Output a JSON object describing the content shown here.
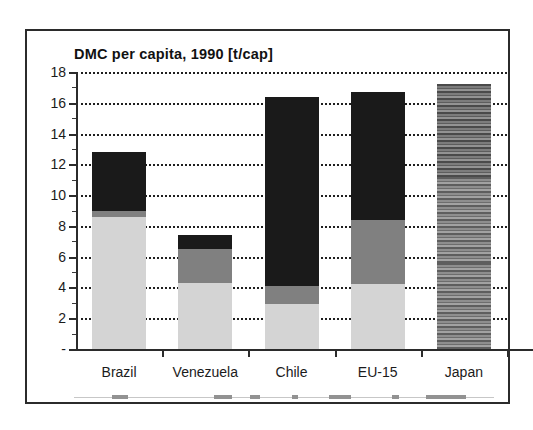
{
  "chart_data": {
    "type": "bar",
    "stacked": true,
    "title": "DMC per capita, 1990 [t/cap]",
    "xlabel": "",
    "ylabel": "",
    "ylim": [
      0,
      18
    ],
    "yticks": [
      "-",
      "2",
      "4",
      "6",
      "8",
      "10",
      "12",
      "14",
      "16",
      "18"
    ],
    "ytick_values": [
      0,
      2,
      4,
      6,
      8,
      10,
      12,
      14,
      16,
      18
    ],
    "grid": true,
    "legend_position": "bottom",
    "categories": [
      "Brazil",
      "Venezuela",
      "Chile",
      "EU-15",
      "Japan"
    ],
    "series": [
      {
        "name": "bottom-segment",
        "color": "#d4d4d4",
        "values": [
          8.6,
          4.3,
          2.9,
          4.2,
          5.6
        ]
      },
      {
        "name": "middle-segment",
        "color": "#808080",
        "values": [
          0.4,
          2.2,
          1.2,
          4.2,
          5.6
        ]
      },
      {
        "name": "top-segment",
        "color": "#1a1a1a",
        "values": [
          3.8,
          0.9,
          12.3,
          8.3,
          6.0
        ]
      }
    ],
    "totals": [
      12.8,
      7.4,
      16.4,
      16.7,
      17.2
    ]
  },
  "title": "DMC per capita, 1990 [t/cap]",
  "axis": {
    "y_labels": [
      "18",
      "16",
      "14",
      "12",
      "10",
      "8",
      "6",
      "4",
      "2",
      "-"
    ],
    "x_labels": [
      "Brazil",
      "Venezuela",
      "Chile",
      "EU-15",
      "Japan"
    ]
  }
}
